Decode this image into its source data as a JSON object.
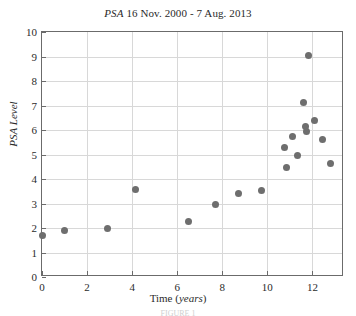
{
  "chart_data": {
    "type": "scatter",
    "title": "PSA 16 Nov. 2000 - 7 Aug. 2013",
    "title_italic_prefix": "PSA",
    "title_rest": " 16 Nov. 2000 - 7 Aug. 2013",
    "xlabel": "Time (years)",
    "xlabel_plain": "Time (",
    "xlabel_italic": "years",
    "xlabel_close": ")",
    "ylabel": "PSA Level",
    "xlim": [
      0,
      13.4
    ],
    "ylim": [
      0,
      10
    ],
    "xticks": [
      0,
      2,
      4,
      6,
      8,
      10,
      12
    ],
    "yticks": [
      0,
      1,
      2,
      3,
      4,
      5,
      6,
      7,
      8,
      9,
      10
    ],
    "grid": true,
    "legend": "none",
    "marker_color": "#6e6e6e",
    "axis_color": "#6b6b6b",
    "grid_color": "#d8d8d8",
    "points": [
      {
        "x": 0.0,
        "y": 1.7
      },
      {
        "x": 1.0,
        "y": 1.88
      },
      {
        "x": 2.9,
        "y": 1.97
      },
      {
        "x": 4.15,
        "y": 3.58
      },
      {
        "x": 6.5,
        "y": 2.28
      },
      {
        "x": 7.7,
        "y": 2.97
      },
      {
        "x": 8.7,
        "y": 3.42
      },
      {
        "x": 9.72,
        "y": 3.52
      },
      {
        "x": 10.75,
        "y": 5.3
      },
      {
        "x": 10.85,
        "y": 4.45
      },
      {
        "x": 11.1,
        "y": 5.72
      },
      {
        "x": 11.35,
        "y": 4.95
      },
      {
        "x": 11.6,
        "y": 7.13
      },
      {
        "x": 11.68,
        "y": 6.15
      },
      {
        "x": 11.72,
        "y": 5.95
      },
      {
        "x": 11.82,
        "y": 9.05
      },
      {
        "x": 12.1,
        "y": 6.4
      },
      {
        "x": 12.45,
        "y": 5.62
      },
      {
        "x": 12.82,
        "y": 4.62
      }
    ]
  },
  "bottom_caption": "FIGURE 1"
}
